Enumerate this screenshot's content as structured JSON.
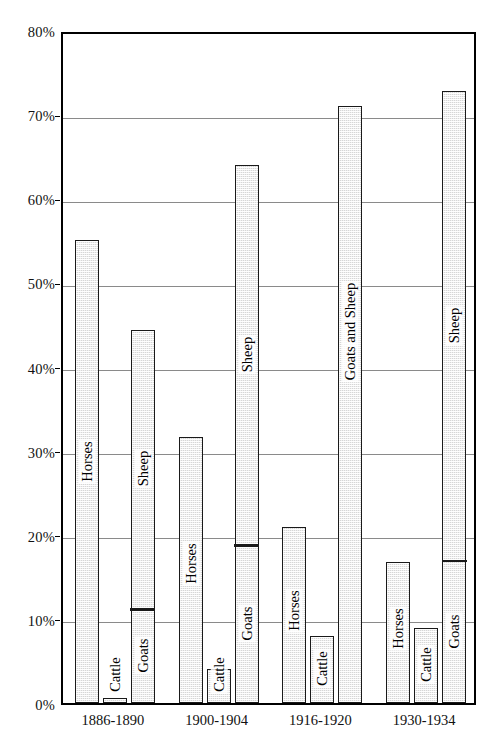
{
  "chart_data": {
    "type": "bar",
    "title": "",
    "xlabel": "",
    "ylabel": "",
    "ylim": [
      0,
      80
    ],
    "grid": true,
    "legend": "none",
    "y_unit": "%",
    "y_ticks": [
      {
        "value": 0,
        "label": "0%"
      },
      {
        "value": 10,
        "label": "10%"
      },
      {
        "value": 20,
        "label": "20%"
      },
      {
        "value": 30,
        "label": "30%"
      },
      {
        "value": 40,
        "label": "40%"
      },
      {
        "value": 50,
        "label": "50%"
      },
      {
        "value": 60,
        "label": "60%"
      },
      {
        "value": 70,
        "label": "70%"
      },
      {
        "value": 80,
        "label": "80%"
      }
    ],
    "categories": [
      "1886-1890",
      "1900-1904",
      "1916-1920",
      "1930-1934"
    ],
    "note": "Within each period group the bars are: Horses, Cattle, and a stacked Goats/Sheep bar. In 1916-1920 the third bar is a single undivided bar labelled 'Goats and Sheep'. In 1930-1934 only the lower 'Goats' segment of the third bar carries a label.",
    "groups": [
      {
        "category": "1886-1890",
        "bars": [
          {
            "name": "Horses",
            "label": "Horses",
            "value": 55.0,
            "stacked": false
          },
          {
            "name": "Cattle",
            "label": "Cattle",
            "value": 0.6,
            "stacked": false
          },
          {
            "name": "Goats and Sheep",
            "label": "",
            "value": 44.4,
            "stacked": true,
            "segments": [
              {
                "name": "Goats",
                "label": "Goats",
                "from": 0,
                "to": 11.0
              },
              {
                "name": "Sheep",
                "label": "Sheep",
                "from": 11.0,
                "to": 44.4
              }
            ]
          }
        ]
      },
      {
        "category": "1900-1904",
        "bars": [
          {
            "name": "Horses",
            "label": "Horses",
            "value": 31.6,
            "stacked": false
          },
          {
            "name": "Cattle",
            "label": "Cattle",
            "value": 4.0,
            "stacked": false
          },
          {
            "name": "Goats and Sheep",
            "label": "",
            "value": 64.0,
            "stacked": true,
            "segments": [
              {
                "name": "Goats",
                "label": "Goats",
                "from": 0,
                "to": 18.6
              },
              {
                "name": "Sheep",
                "label": "Sheep",
                "from": 18.6,
                "to": 64.0
              }
            ]
          }
        ]
      },
      {
        "category": "1916-1920",
        "bars": [
          {
            "name": "Horses",
            "label": "Horses",
            "value": 20.9,
            "stacked": false
          },
          {
            "name": "Cattle",
            "label": "Cattle",
            "value": 8.0,
            "stacked": false
          },
          {
            "name": "Goats and Sheep",
            "label": "Goats and Sheep",
            "value": 71.0,
            "stacked": false
          }
        ]
      },
      {
        "category": "1930-1934",
        "bars": [
          {
            "name": "Horses",
            "label": "Horses",
            "value": 16.8,
            "stacked": false
          },
          {
            "name": "Cattle",
            "label": "Cattle",
            "value": 8.9,
            "stacked": false
          },
          {
            "name": "Goats and Sheep",
            "label": "",
            "value": 72.8,
            "stacked": true,
            "segments": [
              {
                "name": "Goats",
                "label": "Goats",
                "from": 0,
                "to": 16.8
              },
              {
                "name": "Sheep",
                "label": "Sheep",
                "from": 16.8,
                "to": 72.8
              }
            ]
          }
        ]
      }
    ],
    "colors": {
      "bar_fill": "#d6d6d6",
      "bar_edge": "#1a1a1a",
      "grid": "#8a8a8a",
      "frame": "#000000",
      "text": "#111111",
      "background": "#ffffff"
    }
  }
}
